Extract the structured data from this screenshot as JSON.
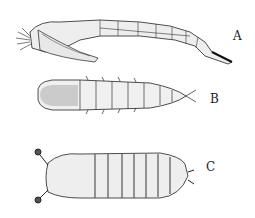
{
  "figure": {
    "panels": [
      {
        "id": "A",
        "label": "A",
        "subject": "elongated segmented larva (lateral view)"
      },
      {
        "id": "B",
        "label": "B",
        "subject": "segmented larva with lateral spines (dorsal view)"
      },
      {
        "id": "C",
        "label": "C",
        "subject": "barrel-shaped larva with anterior hooks"
      }
    ]
  },
  "colors": {
    "ink": "#222222",
    "shade": "#555555",
    "light": "#dddddd",
    "background": "#ffffff"
  }
}
